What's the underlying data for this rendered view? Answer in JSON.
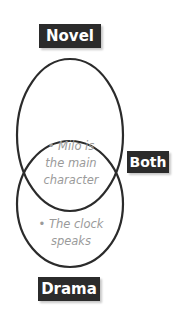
{
  "diagram": {
    "type": "venn",
    "sets": [
      {
        "label": "Novel",
        "items": []
      },
      {
        "label": "Drama",
        "items": [
          {
            "bullet": "•",
            "text": "The clock speaks"
          }
        ]
      }
    ],
    "intersection": {
      "label": "Both",
      "items": [
        {
          "bullet": "•",
          "text": "Milo is the main character"
        }
      ]
    },
    "colors": {
      "label_bg": "#2b2b2b",
      "label_text": "#ffffff",
      "outline": "#2b2b2b",
      "item_text": "#9a9a9a"
    }
  },
  "labels": {
    "novel": "Novel",
    "both": "Both",
    "drama": "Drama"
  },
  "text": {
    "both_item_line1": "• Milo is",
    "both_item_line2": "the main",
    "both_item_line3": "character",
    "drama_item_line1": "• The clock",
    "drama_item_line2": "speaks"
  }
}
